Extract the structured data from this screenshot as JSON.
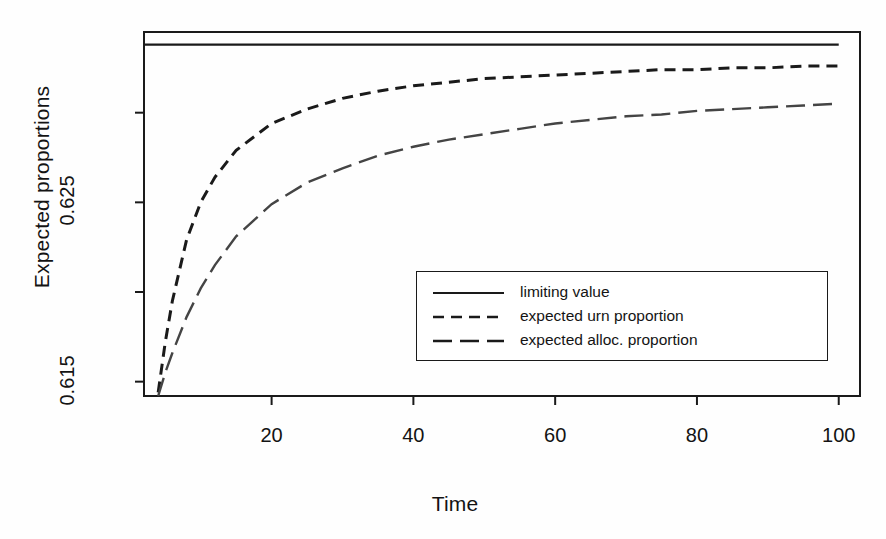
{
  "chart_data": {
    "type": "line",
    "title": "",
    "xlabel": "Time",
    "ylabel": "Expected proportions",
    "xlim": [
      2,
      103
    ],
    "ylim": [
      0.6142,
      0.6345
    ],
    "xticks": [
      20,
      40,
      60,
      80,
      100
    ],
    "xtick_labels": [
      "20",
      "40",
      "60",
      "80",
      "100"
    ],
    "yticks": [
      0.63,
      0.625,
      0.62,
      0.615
    ],
    "ytick_labels": [
      "",
      "0.625",
      "",
      "0.615"
    ],
    "grid": false,
    "legend_position": "center-right-lower",
    "series": [
      {
        "name": "limiting value",
        "style": "solid",
        "color": "#1a1a1a",
        "x": [
          2,
          100
        ],
        "values": [
          0.6338,
          0.6338
        ]
      },
      {
        "name": "expected urn proportion",
        "style": "dashed",
        "color": "#1a1a1a",
        "x": [
          4,
          5,
          6,
          8,
          10,
          12,
          15,
          20,
          25,
          30,
          35,
          40,
          45,
          50,
          55,
          60,
          65,
          70,
          75,
          80,
          85,
          90,
          95,
          100
        ],
        "values": [
          0.6144,
          0.6172,
          0.6195,
          0.6229,
          0.625,
          0.6264,
          0.6279,
          0.6294,
          0.6302,
          0.6308,
          0.6312,
          0.6315,
          0.6317,
          0.6319,
          0.632,
          0.6321,
          0.6322,
          0.6323,
          0.6324,
          0.6324,
          0.6325,
          0.6325,
          0.6326,
          0.6326
        ]
      },
      {
        "name": "expected alloc. proportion",
        "style": "longdash",
        "color": "#444444",
        "x": [
          4,
          5,
          6,
          8,
          10,
          12,
          15,
          20,
          25,
          30,
          35,
          40,
          45,
          50,
          55,
          60,
          65,
          70,
          75,
          80,
          85,
          90,
          95,
          100
        ],
        "values": [
          0.6142,
          0.6155,
          0.6166,
          0.6186,
          0.6202,
          0.6215,
          0.6231,
          0.6249,
          0.6261,
          0.6269,
          0.6276,
          0.6281,
          0.6285,
          0.6288,
          0.6291,
          0.6294,
          0.6296,
          0.6298,
          0.6299,
          0.6301,
          0.6302,
          0.6303,
          0.6304,
          0.6305
        ]
      }
    ]
  },
  "legend": {
    "items": [
      {
        "label": "limiting value",
        "style": "solid"
      },
      {
        "label": "expected urn proportion",
        "style": "dashed"
      },
      {
        "label": "expected alloc. proportion",
        "style": "longdash"
      }
    ]
  },
  "colors": {
    "axis": "#1a1a1a",
    "background": "#fefefe",
    "series_solid": "#1a1a1a",
    "series_dashed": "#1a1a1a",
    "series_longdash": "#555555"
  }
}
